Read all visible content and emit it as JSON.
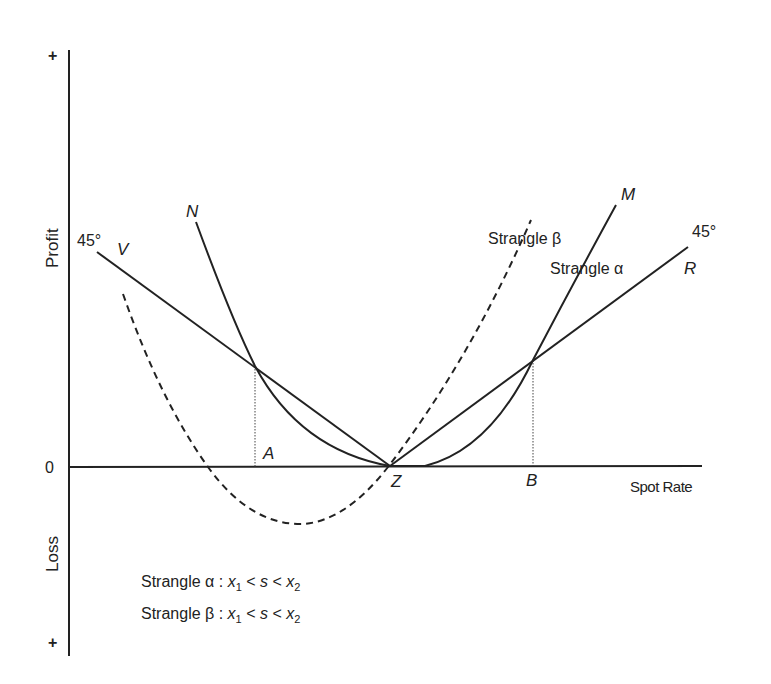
{
  "diagram": {
    "type": "option payoff diagram (strangle)",
    "y_axis": {
      "label_top": "Profit",
      "label_bottom": "Loss",
      "top_sign": "+",
      "bottom_sign": "+",
      "zero_label": "0"
    },
    "x_axis": {
      "label": "Spot Rate"
    },
    "points": {
      "A": "A",
      "B": "B",
      "Z": "Z"
    },
    "curves": {
      "V": "V",
      "R": "R",
      "N": "N",
      "M": "M",
      "angle_left": "45°",
      "angle_right": "45°",
      "strangle_beta": "Strangle β",
      "strangle_alpha": "Strangle α"
    },
    "legend": {
      "line1_prefix": "Strangle α : ",
      "line2_prefix": "Strangle β : ",
      "x1": "x",
      "sub1": "1",
      "lt": " < ",
      "s": "s",
      "x2": "x",
      "sub2": "2"
    },
    "colors": {
      "ink": "#222222",
      "background": "#ffffff"
    }
  }
}
